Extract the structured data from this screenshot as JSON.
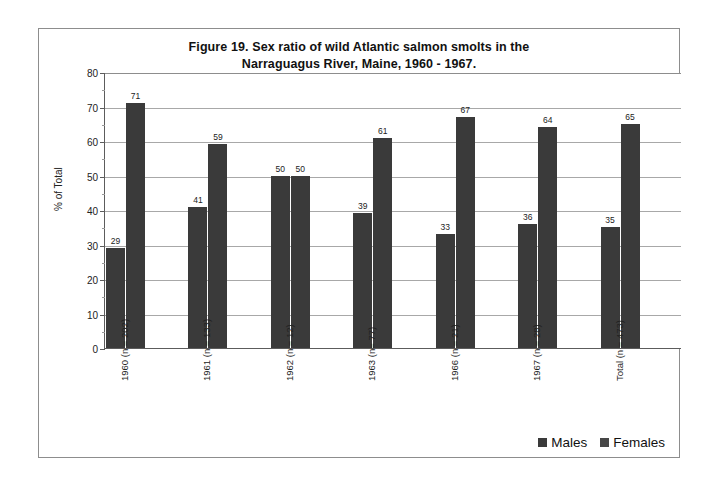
{
  "figure": {
    "title_line1": "Figure 19. Sex ratio of wild Atlantic salmon smolts in the",
    "title_line2": "Narraguagus River, Maine, 1960 - 1967."
  },
  "legend": {
    "males_label": "Males",
    "females_label": "Females",
    "males_color": "#3a3a3a",
    "females_color": "#474747"
  },
  "chart_data": {
    "type": "bar",
    "title": "Figure 19. Sex ratio of wild Atlantic salmon smolts in the Narraguagus River, Maine, 1960 - 1967.",
    "xlabel": "",
    "ylabel": "% of Total",
    "ylim": [
      0,
      80
    ],
    "yticks": [
      0,
      10,
      20,
      30,
      40,
      50,
      60,
      70,
      80
    ],
    "ytick_labels": [
      "0",
      "10",
      "20",
      "30",
      "40",
      "50",
      "60",
      "70",
      "80"
    ],
    "grid": true,
    "legend_position": "bottom-right",
    "categories": [
      "1960 (n = 202)",
      "1961 (n = 133)",
      "1962 (n = 12)",
      "1963 (n= 77)",
      "1966 (n = 21)",
      "1967 (n = 28)",
      "Total (n = 473)"
    ],
    "series": [
      {
        "name": "Males",
        "color": "#3a3a3a",
        "values": [
          29,
          41,
          50,
          39,
          33,
          36,
          35
        ],
        "value_labels": [
          "29",
          "41",
          "50",
          "39",
          "33",
          "36",
          "35"
        ]
      },
      {
        "name": "Females",
        "color": "#3a3a3a",
        "values": [
          71,
          59,
          50,
          61,
          67,
          64,
          65
        ],
        "value_labels": [
          "71",
          "59",
          "50",
          "61",
          "67",
          "64",
          "65"
        ]
      }
    ]
  }
}
